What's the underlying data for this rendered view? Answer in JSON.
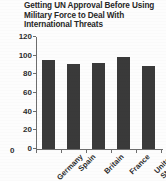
{
  "chart_data": {
    "type": "bar",
    "title": "Getting UN Approval Before Using Military Force to Deal With International Threats",
    "title_lines": [
      "Getting UN Approval Before Using",
      "Military Force to Deal With",
      "International Threats"
    ],
    "categories": [
      "Germany",
      "Spain",
      "Britain",
      "France",
      "United States"
    ],
    "category_lines": [
      [
        "Germany"
      ],
      [
        "Spain"
      ],
      [
        "Britain"
      ],
      [
        "France"
      ],
      [
        "United",
        "States"
      ]
    ],
    "values": [
      95,
      91,
      92,
      99,
      89
    ],
    "xlabel": "",
    "ylabel": "",
    "ylim": [
      0,
      120
    ],
    "ytick_values": [
      0,
      20,
      40,
      60,
      80,
      100,
      120
    ],
    "ytick_labels": [
      "0",
      "20",
      "40",
      "60",
      "80",
      "100",
      "120"
    ],
    "grid": false,
    "legend": false,
    "legend_position": "none",
    "bar_color": "#3a3a3a",
    "axis_color": "#6d6d6d",
    "background_color": "#fdfdfd",
    "text_color": "#2d2d2d"
  }
}
